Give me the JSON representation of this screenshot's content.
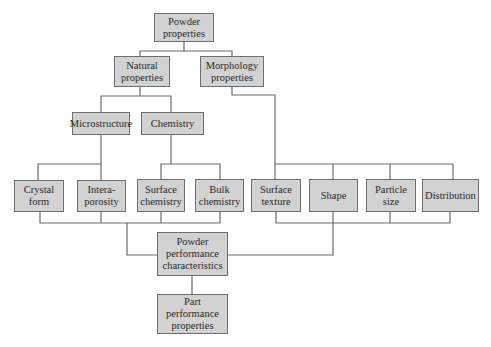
{
  "diagram": {
    "type": "hierarchy-flowchart",
    "colors": {
      "box_fill": "#d2d2d2",
      "box_border": "#6e6e6e",
      "line": "#6a6a6a",
      "text": "#2a2a2a"
    },
    "nodes": {
      "powder_properties": "Powder\nproperties",
      "natural_properties": "Natural\nproperties",
      "morphology_properties": "Morphology\nproperties",
      "microstructure": "Microstructure",
      "chemistry": "Chemistry",
      "crystal_form": "Crystal\nform",
      "interaporosity": "Intera-\nporosity",
      "surface_chemistry": "Surface\nchemistry",
      "bulk_chemistry": "Bulk\nchemistry",
      "surface_texture": "Surface\ntexture",
      "shape": "Shape",
      "particle_size": "Particle\nsize",
      "distribution": "Distribution",
      "powder_performance": "Powder\nperformance\ncharacteristics",
      "part_performance": "Part\nperformance\nproperties"
    },
    "edges": [
      [
        "powder_properties",
        "natural_properties"
      ],
      [
        "powder_properties",
        "morphology_properties"
      ],
      [
        "natural_properties",
        "microstructure"
      ],
      [
        "natural_properties",
        "chemistry"
      ],
      [
        "microstructure",
        "crystal_form"
      ],
      [
        "microstructure",
        "interaporosity"
      ],
      [
        "chemistry",
        "surface_chemistry"
      ],
      [
        "chemistry",
        "bulk_chemistry"
      ],
      [
        "morphology_properties",
        "surface_texture"
      ],
      [
        "morphology_properties",
        "shape"
      ],
      [
        "morphology_properties",
        "particle_size"
      ],
      [
        "morphology_properties",
        "distribution"
      ],
      [
        "crystal_form",
        "powder_performance"
      ],
      [
        "interaporosity",
        "powder_performance"
      ],
      [
        "surface_chemistry",
        "powder_performance"
      ],
      [
        "bulk_chemistry",
        "powder_performance"
      ],
      [
        "surface_texture",
        "powder_performance"
      ],
      [
        "shape",
        "powder_performance"
      ],
      [
        "particle_size",
        "powder_performance"
      ],
      [
        "distribution",
        "powder_performance"
      ],
      [
        "powder_performance",
        "part_performance"
      ]
    ]
  }
}
